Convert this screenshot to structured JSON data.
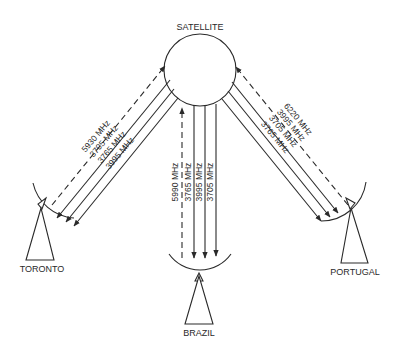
{
  "diagram": {
    "satellite": {
      "label": "SATELLITE"
    },
    "stations": {
      "toronto": {
        "label": "TORONTO",
        "uplink": "5930 MHz",
        "downlinks": [
          "3705 MHz",
          "3765 MHz",
          "3995 MHz"
        ]
      },
      "brazil": {
        "label": "BRAZIL",
        "uplink": "5990 MHz",
        "downlinks": [
          "3765 MHz",
          "3995 MHz",
          "3705 MHz"
        ]
      },
      "portugal": {
        "label": "PORTUGAL",
        "uplink": "6220 MHz",
        "downlinks": [
          "3995 MHz",
          "3705 MHz",
          "3765 MHz"
        ]
      }
    },
    "legend_notes": {
      "dashed": "uplink (earth station to satellite)",
      "solid": "downlink (satellite to earth station)"
    }
  }
}
